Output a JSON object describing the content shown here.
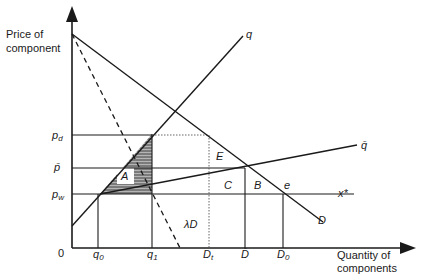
{
  "axes": {
    "y_label_line1": "Price of",
    "y_label_line2": "component",
    "x_label_line1": "Quantity of",
    "x_label_line2": "components",
    "origin": "0"
  },
  "price_ticks": {
    "pd": "p",
    "pd_sub": "d",
    "pbar": "p̄",
    "pw": "p",
    "pw_sub": "w"
  },
  "quantity_ticks": {
    "q0": "q",
    "q0_sub": "0",
    "q1": "q",
    "q1_sub": "1",
    "Dt": "D",
    "Dt_sub": "t",
    "Dbar": "D̄",
    "D0": "D",
    "D0_sub": "0"
  },
  "curves": {
    "supply_q": "q",
    "supply_qbar": "q̄",
    "demand_D": "D",
    "scaled_demand": "λD",
    "world_supply": "x*"
  },
  "regions": {
    "A": "A",
    "B": "B",
    "C": "C",
    "E": "E",
    "e": "e"
  },
  "colors": {
    "ink": "#1a1a1a",
    "hatch_fill": "#9a9a9a"
  }
}
